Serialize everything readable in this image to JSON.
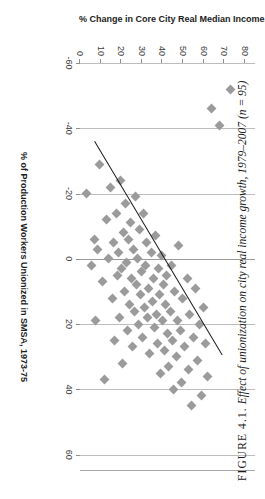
{
  "figure": {
    "caption_label": "FIGURE 4.1.",
    "caption_text": "Effect of unionization on city real income growth, 1979–2007 (n = 95)"
  },
  "chart_data": {
    "type": "scatter",
    "title": "",
    "xlabel": "% of Production Workers Unionized in SMSA, 1973-75",
    "ylabel": "% Change in Core City Real Median Income, 1979-2007",
    "xlim": [
      0,
      85
    ],
    "ylim": [
      -60,
      65
    ],
    "xticks": [
      0,
      10,
      20,
      30,
      40,
      50,
      60,
      70,
      80
    ],
    "yticks": [
      60,
      40,
      20,
      0,
      -20,
      -40,
      -60
    ],
    "grid": "vertical",
    "legend": "none",
    "n": 95,
    "marker": "diamond",
    "marker_color": "#9b9b9b",
    "trendline": {
      "color": "#1a1a1a",
      "x_start": 7.5,
      "y_start": -36.0,
      "x_end": 69.5,
      "y_end": 29.5
    },
    "points": [
      {
        "x": 3.0,
        "y": -20.0
      },
      {
        "x": 5.5,
        "y": 2.0
      },
      {
        "x": 7.0,
        "y": -6.0
      },
      {
        "x": 7.5,
        "y": 19.0
      },
      {
        "x": 8.5,
        "y": -3.0
      },
      {
        "x": 9.5,
        "y": -29.0
      },
      {
        "x": 11.0,
        "y": 7.0
      },
      {
        "x": 12.0,
        "y": 37.0
      },
      {
        "x": 13.0,
        "y": -12.0
      },
      {
        "x": 14.0,
        "y": 0.0
      },
      {
        "x": 15.0,
        "y": -22.0
      },
      {
        "x": 16.0,
        "y": 12.0
      },
      {
        "x": 16.5,
        "y": -5.0
      },
      {
        "x": 17.0,
        "y": 25.0
      },
      {
        "x": 17.5,
        "y": -14.0
      },
      {
        "x": 18.0,
        "y": 5.0
      },
      {
        "x": 18.5,
        "y": -2.0
      },
      {
        "x": 19.0,
        "y": 18.0
      },
      {
        "x": 19.5,
        "y": -24.0
      },
      {
        "x": 20.0,
        "y": 3.0
      },
      {
        "x": 20.5,
        "y": 32.0
      },
      {
        "x": 21.0,
        "y": -8.0
      },
      {
        "x": 21.5,
        "y": 10.0
      },
      {
        "x": 22.0,
        "y": -17.0
      },
      {
        "x": 22.5,
        "y": 1.0
      },
      {
        "x": 23.0,
        "y": 22.0
      },
      {
        "x": 23.5,
        "y": -6.0
      },
      {
        "x": 24.0,
        "y": 14.0
      },
      {
        "x": 24.5,
        "y": -11.0
      },
      {
        "x": 25.0,
        "y": 6.0
      },
      {
        "x": 25.5,
        "y": 27.0
      },
      {
        "x": 26.0,
        "y": -3.0
      },
      {
        "x": 26.5,
        "y": 16.0
      },
      {
        "x": 27.0,
        "y": -19.0
      },
      {
        "x": 27.5,
        "y": 8.0
      },
      {
        "x": 28.0,
        "y": 0.0
      },
      {
        "x": 28.5,
        "y": 20.0
      },
      {
        "x": 29.0,
        "y": -9.0
      },
      {
        "x": 29.5,
        "y": 11.0
      },
      {
        "x": 30.0,
        "y": 4.0
      },
      {
        "x": 30.5,
        "y": 24.0
      },
      {
        "x": 31.0,
        "y": -14.0
      },
      {
        "x": 31.5,
        "y": 15.0
      },
      {
        "x": 32.0,
        "y": 2.0
      },
      {
        "x": 32.5,
        "y": -5.0
      },
      {
        "x": 33.0,
        "y": 18.0
      },
      {
        "x": 33.5,
        "y": 9.0
      },
      {
        "x": 34.0,
        "y": 29.0
      },
      {
        "x": 34.5,
        "y": -2.0
      },
      {
        "x": 35.0,
        "y": 13.0
      },
      {
        "x": 35.5,
        "y": 6.0
      },
      {
        "x": 36.0,
        "y": 21.0
      },
      {
        "x": 36.5,
        "y": -7.0
      },
      {
        "x": 37.0,
        "y": 17.0
      },
      {
        "x": 37.5,
        "y": 26.0
      },
      {
        "x": 38.0,
        "y": 3.0
      },
      {
        "x": 38.5,
        "y": 11.0
      },
      {
        "x": 39.0,
        "y": 35.0
      },
      {
        "x": 39.5,
        "y": -1.0
      },
      {
        "x": 40.0,
        "y": 19.0
      },
      {
        "x": 40.5,
        "y": 8.0
      },
      {
        "x": 41.0,
        "y": 28.0
      },
      {
        "x": 41.5,
        "y": 14.0
      },
      {
        "x": 42.0,
        "y": 5.0
      },
      {
        "x": 42.5,
        "y": 23.0
      },
      {
        "x": 43.0,
        "y": 33.0
      },
      {
        "x": 44.0,
        "y": 16.0
      },
      {
        "x": 44.5,
        "y": 2.0
      },
      {
        "x": 45.0,
        "y": 25.0
      },
      {
        "x": 45.5,
        "y": 40.0
      },
      {
        "x": 46.0,
        "y": 10.0
      },
      {
        "x": 47.0,
        "y": 30.0
      },
      {
        "x": 47.5,
        "y": 19.0
      },
      {
        "x": 48.0,
        "y": -4.0
      },
      {
        "x": 49.0,
        "y": 22.0
      },
      {
        "x": 49.5,
        "y": 38.0
      },
      {
        "x": 50.0,
        "y": 12.0
      },
      {
        "x": 51.0,
        "y": 27.0
      },
      {
        "x": 52.0,
        "y": 6.0
      },
      {
        "x": 52.5,
        "y": 34.0
      },
      {
        "x": 53.0,
        "y": 17.0
      },
      {
        "x": 54.0,
        "y": 45.0
      },
      {
        "x": 55.0,
        "y": 24.0
      },
      {
        "x": 56.0,
        "y": 9.0
      },
      {
        "x": 57.0,
        "y": 31.0
      },
      {
        "x": 58.0,
        "y": 20.0
      },
      {
        "x": 59.0,
        "y": 42.0
      },
      {
        "x": 60.0,
        "y": 15.0
      },
      {
        "x": 61.0,
        "y": 26.0
      },
      {
        "x": 62.0,
        "y": 36.0
      },
      {
        "x": 64.0,
        "y": -46.0
      },
      {
        "x": 68.0,
        "y": -41.0
      },
      {
        "x": 73.0,
        "y": -52.0
      }
    ]
  }
}
